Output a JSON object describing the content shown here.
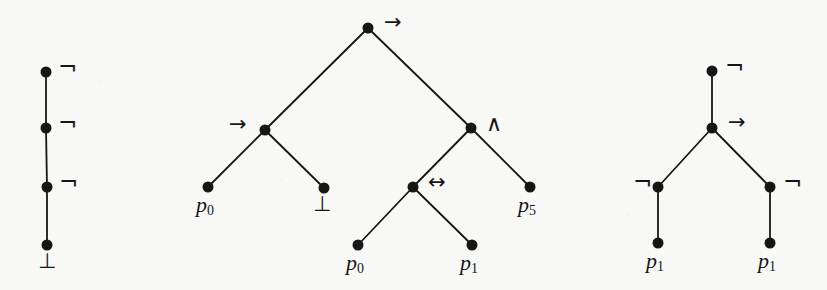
{
  "figure": {
    "title": "",
    "background_color": "#f8f8f6",
    "ink_color": "#161616",
    "node_radius": 5.5,
    "edge_width": 1.8,
    "width": 827,
    "height": 290
  },
  "symbols": {
    "negation": "¬",
    "implication": "→",
    "conjunction": "∧",
    "biconditional": "↔",
    "falsum": "⊥"
  },
  "trees": [
    {
      "id": "tree-left",
      "name": "negation-chain-tree",
      "nodes": [
        {
          "id": "L0",
          "label": "¬",
          "kind": "operator",
          "x": 46,
          "y": 72,
          "label_x": 58,
          "label_y": 56,
          "label_pos": "right"
        },
        {
          "id": "L1",
          "label": "¬",
          "kind": "operator",
          "x": 46,
          "y": 128,
          "label_x": 58,
          "label_y": 112,
          "label_pos": "right"
        },
        {
          "id": "L2",
          "label": "¬",
          "kind": "operator",
          "x": 47,
          "y": 187,
          "label_x": 59,
          "label_y": 171,
          "label_pos": "right"
        },
        {
          "id": "L3",
          "label": "⊥",
          "kind": "falsum",
          "x": 47,
          "y": 245,
          "label_x": 38,
          "label_y": 251,
          "label_pos": "below"
        }
      ],
      "edges": [
        {
          "from": "L0",
          "to": "L1"
        },
        {
          "from": "L1",
          "to": "L2"
        },
        {
          "from": "L2",
          "to": "L3"
        }
      ]
    },
    {
      "id": "tree-middle",
      "name": "implication-tree",
      "nodes": [
        {
          "id": "M0",
          "label": "→",
          "kind": "operator",
          "x": 368,
          "y": 28,
          "label_x": 384,
          "label_y": 12,
          "label_pos": "right"
        },
        {
          "id": "M1",
          "label": "→",
          "kind": "operator",
          "x": 265,
          "y": 130,
          "label_x": 229,
          "label_y": 114,
          "label_pos": "left"
        },
        {
          "id": "M2",
          "label": "∧",
          "kind": "operator",
          "x": 471,
          "y": 128,
          "label_x": 486,
          "label_y": 113,
          "label_pos": "right"
        },
        {
          "id": "M3",
          "label": "p0",
          "kind": "atom",
          "x": 208,
          "y": 187,
          "label_x": 196,
          "label_y": 194,
          "label_pos": "below",
          "atom": "p",
          "sub": "0"
        },
        {
          "id": "M4",
          "label": "⊥",
          "kind": "falsum",
          "x": 324,
          "y": 188,
          "label_x": 313,
          "label_y": 194,
          "label_pos": "below"
        },
        {
          "id": "M5",
          "label": "↔",
          "kind": "operator",
          "x": 413,
          "y": 187,
          "label_x": 428,
          "label_y": 172,
          "label_pos": "right"
        },
        {
          "id": "M6",
          "label": "p5",
          "kind": "atom",
          "x": 530,
          "y": 187,
          "label_x": 518,
          "label_y": 194,
          "label_pos": "below",
          "atom": "p",
          "sub": "5"
        },
        {
          "id": "M7",
          "label": "p0",
          "kind": "atom",
          "x": 358,
          "y": 245,
          "label_x": 346,
          "label_y": 252,
          "label_pos": "below",
          "atom": "p",
          "sub": "0"
        },
        {
          "id": "M8",
          "label": "p1",
          "kind": "atom",
          "x": 472,
          "y": 245,
          "label_x": 460,
          "label_y": 252,
          "label_pos": "below",
          "atom": "p",
          "sub": "1"
        }
      ],
      "edges": [
        {
          "from": "M0",
          "to": "M1"
        },
        {
          "from": "M0",
          "to": "M2"
        },
        {
          "from": "M1",
          "to": "M3"
        },
        {
          "from": "M1",
          "to": "M4"
        },
        {
          "from": "M2",
          "to": "M5"
        },
        {
          "from": "M2",
          "to": "M6"
        },
        {
          "from": "M5",
          "to": "M7"
        },
        {
          "from": "M5",
          "to": "M8"
        }
      ]
    },
    {
      "id": "tree-right",
      "name": "negated-implication-tree",
      "nodes": [
        {
          "id": "R0",
          "label": "¬",
          "kind": "operator",
          "x": 712,
          "y": 71,
          "label_x": 725,
          "label_y": 55,
          "label_pos": "right"
        },
        {
          "id": "R1",
          "label": "→",
          "kind": "operator",
          "x": 712,
          "y": 128,
          "label_x": 728,
          "label_y": 112,
          "label_pos": "right"
        },
        {
          "id": "R2",
          "label": "¬",
          "kind": "operator",
          "x": 658,
          "y": 187,
          "label_x": 633,
          "label_y": 171,
          "label_pos": "left"
        },
        {
          "id": "R3",
          "label": "¬",
          "kind": "operator",
          "x": 770,
          "y": 187,
          "label_x": 783,
          "label_y": 171,
          "label_pos": "right"
        },
        {
          "id": "R4",
          "label": "p1",
          "kind": "atom",
          "x": 658,
          "y": 243,
          "label_x": 646,
          "label_y": 250,
          "label_pos": "below",
          "atom": "p",
          "sub": "1"
        },
        {
          "id": "R5",
          "label": "p1",
          "kind": "atom",
          "x": 770,
          "y": 243,
          "label_x": 758,
          "label_y": 250,
          "label_pos": "below",
          "atom": "p",
          "sub": "1"
        }
      ],
      "edges": [
        {
          "from": "R0",
          "to": "R1"
        },
        {
          "from": "R1",
          "to": "R2"
        },
        {
          "from": "R1",
          "to": "R3"
        },
        {
          "from": "R2",
          "to": "R4"
        },
        {
          "from": "R3",
          "to": "R5"
        }
      ]
    }
  ]
}
